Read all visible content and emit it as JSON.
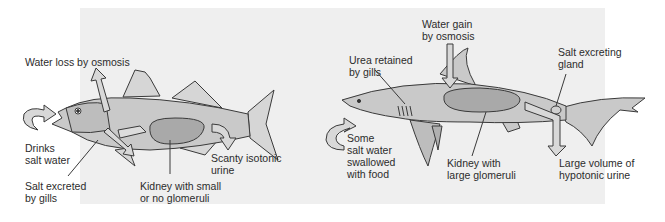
{
  "figure": {
    "left_panel": {
      "subject": "bony marine fish",
      "labels": {
        "water_loss": "Water loss by osmosis",
        "drinks": "Drinks\nsalt water",
        "salt_gills": "Salt excreted\nby gills",
        "kidney": "Kidney with small\nor no glomeruli",
        "urine": "Scanty isotonic\nurine"
      }
    },
    "right_panel": {
      "subject": "shark",
      "labels": {
        "water_gain": "Water gain\nby osmosis",
        "urea": "Urea retained\nby gills",
        "salt_gland": "Salt excreting\ngland",
        "swallowed": "Some\nsalt water\nswallowed\nwith food",
        "kidney": "Kidney with\nlarge glomeruli",
        "urine": "Large volume of\nhypotonic urine"
      }
    },
    "colors": {
      "panel_bg": "#efefef",
      "body_fill": "#c9c9c9",
      "kidney_fill": "#a9a9a9",
      "arrow_fill": "#d8d8d8",
      "outline": "#3a3a3a"
    }
  }
}
